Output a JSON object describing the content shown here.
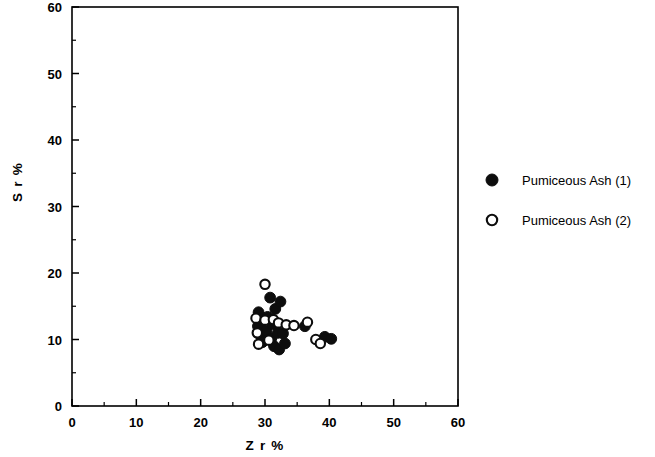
{
  "chart_data": {
    "type": "scatter",
    "title": "",
    "xlabel": "Z r %",
    "ylabel": "S r %",
    "xlim": [
      0,
      60
    ],
    "ylim": [
      0,
      60
    ],
    "xticks": [
      0,
      10,
      20,
      30,
      40,
      50,
      60
    ],
    "yticks": [
      0,
      10,
      20,
      30,
      40,
      50,
      60
    ],
    "xtick_labels": [
      "0",
      "10",
      "20",
      "30",
      "40",
      "50",
      "60"
    ],
    "ytick_labels": [
      "0",
      "10",
      "20",
      "30",
      "40",
      "50",
      "60"
    ],
    "minor_tick_step": 5,
    "grid": false,
    "legend_position": "right",
    "marker_color": "#0d0d0d",
    "background_color": "#ffffff",
    "series": [
      {
        "name": "Pumiceous Ash (1)",
        "marker": "filled-circle",
        "points": [
          [
            29.0,
            14.1
          ],
          [
            29.3,
            12.6
          ],
          [
            28.9,
            12.0
          ],
          [
            29.2,
            10.7
          ],
          [
            29.6,
            9.6
          ],
          [
            30.2,
            11.3
          ],
          [
            30.4,
            13.4
          ],
          [
            30.8,
            16.3
          ],
          [
            31.0,
            10.2
          ],
          [
            31.2,
            12.3
          ],
          [
            31.4,
            9.0
          ],
          [
            31.6,
            14.6
          ],
          [
            32.0,
            11.0
          ],
          [
            32.2,
            8.5
          ],
          [
            32.4,
            15.7
          ],
          [
            32.8,
            10.9
          ],
          [
            33.1,
            9.4
          ],
          [
            36.2,
            12.0
          ],
          [
            39.3,
            10.4
          ],
          [
            40.3,
            10.1
          ]
        ]
      },
      {
        "name": "Pumiceous Ash (2)",
        "marker": "open-circle",
        "points": [
          [
            30.0,
            18.3
          ],
          [
            28.6,
            13.2
          ],
          [
            28.8,
            11.0
          ],
          [
            29.0,
            9.3
          ],
          [
            30.0,
            12.9
          ],
          [
            30.6,
            9.9
          ],
          [
            31.3,
            13.0
          ],
          [
            32.1,
            12.5
          ],
          [
            33.3,
            12.2
          ],
          [
            34.5,
            12.1
          ],
          [
            36.6,
            12.6
          ],
          [
            37.9,
            10.0
          ],
          [
            38.6,
            9.4
          ]
        ]
      }
    ]
  },
  "legend": {
    "items": [
      {
        "label": "Pumiceous Ash (1)",
        "marker": "filled-circle"
      },
      {
        "label": "Pumiceous Ash (2)",
        "marker": "open-circle"
      }
    ]
  }
}
